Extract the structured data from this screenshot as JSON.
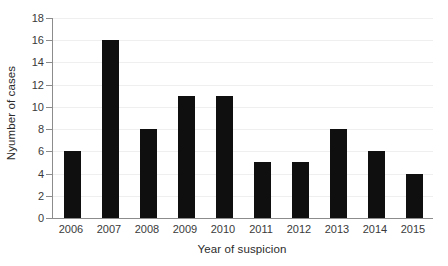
{
  "chart_data": {
    "type": "bar",
    "title": "",
    "subtitle": "",
    "xlabel": "Year of suspicion",
    "ylabel": "Nyumber of cases",
    "categories": [
      "2006",
      "2007",
      "2008",
      "2009",
      "2010",
      "2011",
      "2012",
      "2013",
      "2014",
      "2015"
    ],
    "values": [
      6,
      16,
      8,
      11,
      11,
      5,
      5,
      8,
      6,
      4
    ],
    "ylim": [
      0,
      18
    ],
    "ytick_step": 2,
    "yticks": [
      "18",
      "16",
      "14",
      "12",
      "10",
      "8",
      "6",
      "4",
      "2",
      "0"
    ],
    "ytick_values": [
      18,
      16,
      14,
      12,
      10,
      8,
      6,
      4,
      2,
      0
    ],
    "grid": true,
    "grid_axis": "y",
    "legend": false,
    "legend_position": "none",
    "bar_color": "#100f0f",
    "axis_color": "#8c8c8c",
    "gridline_color": "#efefef",
    "background_color": "#ffffff",
    "text_color": "#2b2b2b"
  }
}
